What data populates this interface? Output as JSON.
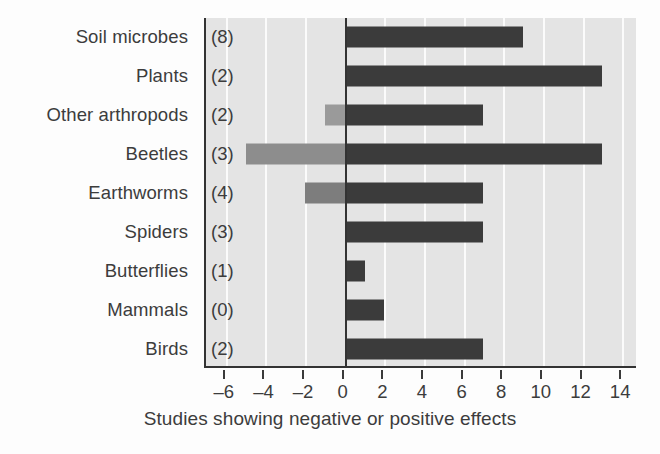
{
  "chart_data": {
    "type": "bar",
    "orientation": "horizontal",
    "title": "",
    "xlabel": "Studies showing negative or positive effects",
    "ylabel": "",
    "xlim": [
      -7,
      14.8
    ],
    "xticks": [
      -6,
      -4,
      -2,
      0,
      2,
      4,
      6,
      8,
      10,
      12,
      14
    ],
    "xtick_labels": [
      "–6",
      "–4",
      "–2",
      "0",
      "2",
      "4",
      "6",
      "8",
      "10",
      "12",
      "14"
    ],
    "grid": "vertical-white",
    "legend": "none",
    "categories": [
      "Soil microbes",
      "Plants",
      "Other arthropods",
      "Beetles",
      "Earthworms",
      "Spiders",
      "Butterflies",
      "Mammals",
      "Birds"
    ],
    "category_counts": [
      "(8)",
      "(2)",
      "(2)",
      "(3)",
      "(4)",
      "(3)",
      "(1)",
      "(0)",
      "(2)"
    ],
    "series": [
      {
        "name": "Studies showing positive effects",
        "color": "#3b3b3b",
        "values": [
          9,
          13,
          7,
          13,
          7,
          7,
          1,
          2,
          7
        ]
      },
      {
        "name": "Studies showing negative effects",
        "color": "#8d8d8d",
        "values": [
          0,
          0,
          -1,
          -5,
          -2,
          0,
          0,
          0,
          0
        ]
      }
    ],
    "negative_bar_colors": [
      "",
      "",
      "#9a9a9a",
      "#8d8d8d",
      "#7d7d7d",
      "",
      "",
      "",
      ""
    ],
    "colors": {
      "positive_bar": "#3b3b3b",
      "negative_bar": "#8d8d8d",
      "plot_background": "#e4e4e4",
      "gridline": "#fbfbfb",
      "axis": "#333333",
      "text": "#3c3c3c"
    }
  }
}
